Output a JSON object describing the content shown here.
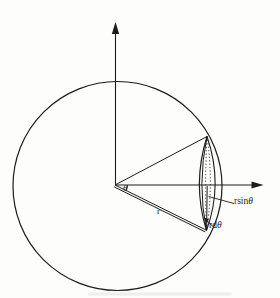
{
  "diagram": {
    "labels": {
      "theta": "θ",
      "r": "r",
      "r_sin_theta": {
        "prefix": "rsin",
        "symbol": "θ"
      },
      "r_d_theta": {
        "prefix": "rd",
        "symbol": "θ"
      }
    },
    "colors": {
      "ink": "#1c1c1c",
      "background": "#fdfdfb"
    }
  }
}
